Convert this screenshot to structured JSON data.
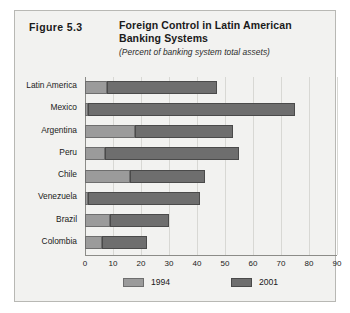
{
  "figure": {
    "number_label": "Figure 5.3",
    "title": "Foreign Control in Latin American Banking Systems",
    "subtitle": "(Percent of banking system total assets)"
  },
  "legend": {
    "position": "bottom",
    "entries": [
      {
        "label": "1994",
        "color": "#9b9b9b"
      },
      {
        "label": "2001",
        "color": "#6e6e6e"
      }
    ]
  },
  "axis": {
    "x_ticks": [
      "0",
      "10",
      "20",
      "30",
      "40",
      "50",
      "60",
      "70",
      "80",
      "90"
    ]
  },
  "chart_data": {
    "type": "bar",
    "orientation": "horizontal",
    "title": "Foreign Control in Latin American Banking Systems",
    "subtitle": "(Percent of banking system total assets)",
    "xlabel": "",
    "ylabel": "",
    "xlim": [
      0,
      90
    ],
    "xticks": [
      0,
      10,
      20,
      30,
      40,
      50,
      60,
      70,
      80,
      90
    ],
    "grid": true,
    "legend_position": "bottom",
    "categories": [
      "Latin America",
      "Mexico",
      "Argentina",
      "Peru",
      "Chile",
      "Venezuela",
      "Brazil",
      "Colombia"
    ],
    "series": [
      {
        "name": "1994",
        "color": "#9b9b9b",
        "values": [
          8,
          1,
          18,
          7,
          16,
          1,
          9,
          6
        ]
      },
      {
        "name": "2001",
        "color": "#6e6e6e",
        "values": [
          47,
          75,
          53,
          55,
          43,
          41,
          30,
          22
        ]
      }
    ]
  }
}
